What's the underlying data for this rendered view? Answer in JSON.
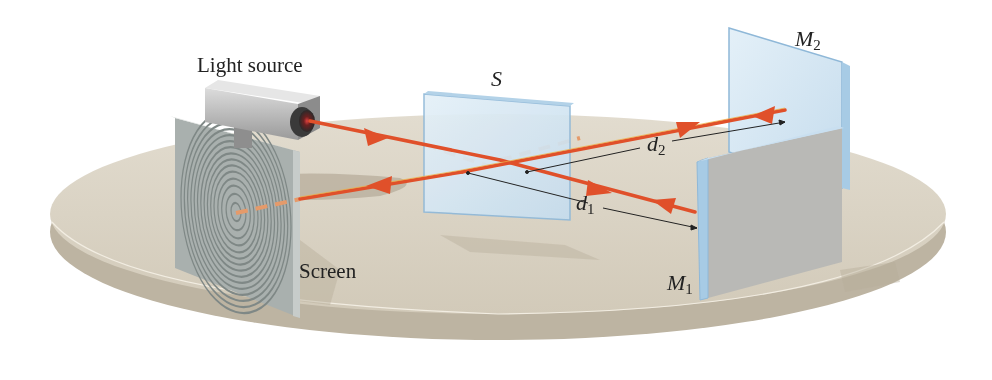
{
  "labels": {
    "light_source": "Light source",
    "screen": "Screen",
    "splitter": "S",
    "mirror1_base": "M",
    "mirror1_sub": "1",
    "mirror2_base": "M",
    "mirror2_sub": "2",
    "d1_base": "d",
    "d1_sub": "1",
    "d2_base": "d",
    "d2_sub": "2"
  },
  "colors": {
    "table_top": "#d9d2c3",
    "table_edge": "#bdb4a2",
    "beam": "#e0502a",
    "beam_dashed": "#e59a6a",
    "glass": "#cfe3f1",
    "glass_edge": "#8fb8d8",
    "mirror_back": "#b9b9b6",
    "screen_face": "#a9b0ae",
    "camera_body": "#c8c8c8"
  }
}
